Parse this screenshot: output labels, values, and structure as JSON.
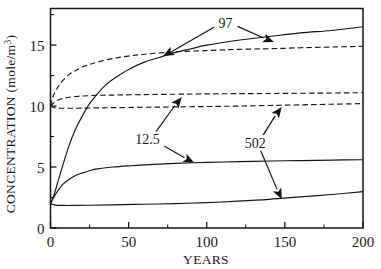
{
  "chart_data": {
    "type": "line",
    "title": "",
    "xlabel": "YEARS",
    "ylabel": "CONCENTRATION (mole/m³)",
    "ylabel_main": "CONCENTRATION (mole/m",
    "ylabel_sup": "3",
    "ylabel_tail": ")",
    "xlim": [
      0,
      200
    ],
    "ylim": [
      0,
      18
    ],
    "grid": false,
    "legend": "none",
    "xticks": [
      0,
      50,
      100,
      150,
      200
    ],
    "xtick_labels": [
      "0",
      "50",
      "100",
      "150",
      "200"
    ],
    "xticks_minor": [
      25,
      75,
      125,
      175
    ],
    "yticks": [
      0,
      5,
      10,
      15
    ],
    "ytick_labels": [
      "0",
      "5",
      "10",
      "15"
    ],
    "yticks_minor": [
      2.5,
      7.5,
      12.5,
      17.5
    ],
    "series": [
      {
        "name": "97-solid",
        "style": "solid",
        "x": [
          0,
          2,
          5,
          8,
          12,
          16,
          20,
          25,
          30,
          35,
          40,
          50,
          60,
          70,
          80,
          90,
          100,
          120,
          140,
          160,
          180,
          200
        ],
        "values": [
          2.0,
          2.6,
          3.9,
          5.2,
          6.8,
          8.1,
          9.1,
          10.2,
          11.0,
          11.7,
          12.2,
          13.0,
          13.6,
          14.0,
          14.4,
          14.7,
          15.0,
          15.4,
          15.7,
          16.0,
          16.2,
          16.5
        ]
      },
      {
        "name": "97-dashed",
        "style": "dashed",
        "x": [
          0,
          2,
          5,
          8,
          12,
          16,
          20,
          25,
          30,
          40,
          50,
          60,
          80,
          100,
          120,
          140,
          160,
          180,
          200
        ],
        "values": [
          10.0,
          10.9,
          11.6,
          12.1,
          12.6,
          12.9,
          13.2,
          13.4,
          13.6,
          13.9,
          14.1,
          14.25,
          14.45,
          14.55,
          14.65,
          14.7,
          14.78,
          14.84,
          14.9
        ]
      },
      {
        "name": "12.5-dashed",
        "style": "dashed",
        "x": [
          0,
          2,
          5,
          8,
          12,
          16,
          20,
          30,
          40,
          60,
          80,
          100,
          140,
          180,
          200
        ],
        "values": [
          10.0,
          10.25,
          10.5,
          10.62,
          10.72,
          10.78,
          10.82,
          10.88,
          10.9,
          10.94,
          10.97,
          11.0,
          11.03,
          11.07,
          11.1
        ]
      },
      {
        "name": "502-dashed",
        "style": "dashed",
        "x": [
          0,
          3,
          8,
          15,
          25,
          40,
          60,
          80,
          100,
          120,
          140,
          160,
          180,
          200
        ],
        "values": [
          10.0,
          9.85,
          9.82,
          9.82,
          9.84,
          9.87,
          9.9,
          9.93,
          9.96,
          10.0,
          10.05,
          10.1,
          10.15,
          10.2
        ]
      },
      {
        "name": "12.5-solid",
        "style": "solid",
        "x": [
          0,
          2,
          5,
          8,
          12,
          16,
          20,
          25,
          30,
          40,
          50,
          60,
          80,
          100,
          120,
          140,
          160,
          180,
          200
        ],
        "values": [
          2.0,
          2.5,
          3.1,
          3.6,
          4.0,
          4.3,
          4.5,
          4.7,
          4.85,
          5.0,
          5.1,
          5.18,
          5.3,
          5.38,
          5.44,
          5.49,
          5.53,
          5.57,
          5.6
        ]
      },
      {
        "name": "502-solid",
        "style": "solid",
        "x": [
          0,
          3,
          8,
          15,
          25,
          40,
          60,
          80,
          100,
          120,
          140,
          160,
          180,
          200
        ],
        "values": [
          2.0,
          1.88,
          1.85,
          1.85,
          1.87,
          1.9,
          1.95,
          2.0,
          2.08,
          2.2,
          2.35,
          2.55,
          2.75,
          2.98
        ]
      }
    ],
    "annotations": [
      {
        "name": "97",
        "label": "97",
        "label_x": 112,
        "label_y": 16.8,
        "arrows": [
          {
            "to_x": 72,
            "to_y": 14.1
          },
          {
            "to_x": 143,
            "to_y": 15.25
          }
        ]
      },
      {
        "name": "12.5",
        "label": "12.5",
        "label_x": 62,
        "label_y": 7.3,
        "arrows": [
          {
            "to_x": 84,
            "to_y": 10.72
          },
          {
            "to_x": 92,
            "to_y": 5.35
          }
        ]
      },
      {
        "name": "502",
        "label": "502",
        "label_x": 131,
        "label_y": 7.0,
        "arrows": [
          {
            "to_x": 148,
            "to_y": 9.92
          },
          {
            "to_x": 148,
            "to_y": 2.35
          }
        ]
      }
    ]
  }
}
